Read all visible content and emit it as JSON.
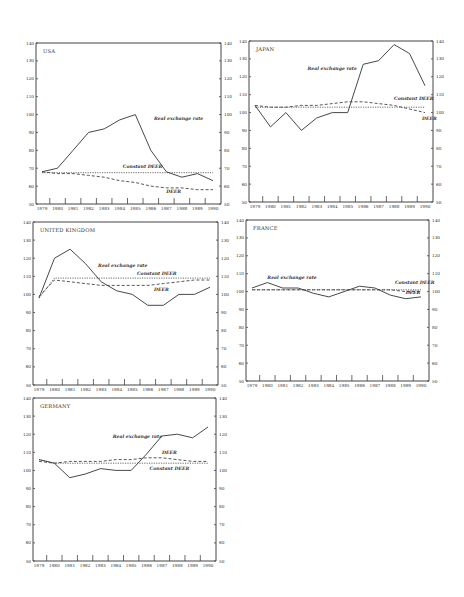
{
  "chart_data": [
    {
      "type": "line",
      "title": "USA",
      "x": [
        1979,
        1980,
        1981,
        1982,
        1983,
        1984,
        1985,
        1986,
        1987,
        1988,
        1989,
        1990
      ],
      "ylim": [
        50,
        140
      ],
      "yticks": [
        50,
        60,
        70,
        80,
        90,
        100,
        110,
        120,
        130,
        140
      ],
      "xlabel": "",
      "ylabel": "",
      "grid": false,
      "series": [
        {
          "name": "Real exchange rate",
          "style": "solid",
          "values": [
            68,
            70,
            80,
            90,
            92,
            97,
            100,
            80,
            68,
            65,
            67,
            63
          ]
        },
        {
          "name": "Constant DEER",
          "style": "dotted",
          "values": [
            67.5,
            67.5,
            67.5,
            67.5,
            67.5,
            67.5,
            67.5,
            67.5,
            67.5,
            67.5,
            67.5,
            67.5
          ]
        },
        {
          "name": "DEER",
          "style": "dashed",
          "values": [
            68,
            67,
            67,
            66,
            65,
            63,
            62,
            60,
            59,
            59,
            58,
            58
          ]
        }
      ],
      "annotations": [
        {
          "text": "Real exchange rate",
          "x": 1986.2,
          "y": 97
        },
        {
          "text": "Constant DEER",
          "x": 1984.2,
          "y": 70
        },
        {
          "text": "DEER",
          "x": 1987.0,
          "y": 56
        }
      ]
    },
    {
      "type": "line",
      "title": "JAPAN",
      "x": [
        1979,
        1980,
        1981,
        1982,
        1983,
        1984,
        1985,
        1986,
        1987,
        1988,
        1989,
        1990
      ],
      "ylim": [
        50,
        140
      ],
      "yticks": [
        50,
        60,
        70,
        80,
        90,
        100,
        110,
        120,
        130,
        140
      ],
      "xlabel": "",
      "ylabel": "",
      "grid": false,
      "series": [
        {
          "name": "Real exchange rate",
          "style": "solid",
          "values": [
            104,
            92,
            100,
            90,
            97,
            100,
            100,
            127,
            129,
            138,
            133,
            115
          ]
        },
        {
          "name": "Constant DEER",
          "style": "dotted",
          "values": [
            103,
            103,
            103,
            103,
            103,
            103,
            103,
            103,
            103,
            103,
            103,
            103
          ]
        },
        {
          "name": "DEER",
          "style": "dashed",
          "values": [
            104,
            103,
            103,
            104,
            104,
            105,
            106,
            106,
            105,
            104,
            102,
            100
          ]
        }
      ],
      "annotations": [
        {
          "text": "Real exchange rate",
          "x": 1982.4,
          "y": 124
        },
        {
          "text": "Constant DEER",
          "x": 1988.0,
          "y": 107
        },
        {
          "text": "DEER",
          "x": 1989.8,
          "y": 96
        }
      ]
    },
    {
      "type": "line",
      "title": "UNITED KINGDOM",
      "x": [
        1979,
        1980,
        1981,
        1982,
        1983,
        1984,
        1985,
        1986,
        1987,
        1988,
        1989,
        1990
      ],
      "ylim": [
        50,
        140
      ],
      "yticks": [
        50,
        60,
        70,
        80,
        90,
        100,
        110,
        120,
        130,
        140
      ],
      "xlabel": "",
      "ylabel": "",
      "grid": false,
      "series": [
        {
          "name": "Real exchange rate",
          "style": "solid",
          "values": [
            98,
            120,
            125,
            117,
            107,
            102,
            100,
            94,
            94,
            100,
            100,
            104
          ]
        },
        {
          "name": "Constant DEER",
          "style": "dotted",
          "values": [
            98,
            109,
            109,
            109,
            109,
            109,
            109,
            109,
            109,
            109,
            109,
            109
          ]
        },
        {
          "name": "DEER",
          "style": "dashed",
          "values": [
            99,
            108,
            107,
            106,
            105,
            105,
            105,
            105,
            106,
            107,
            108,
            108
          ]
        }
      ],
      "annotations": [
        {
          "text": "Real exchange rate",
          "x": 1982.8,
          "y": 115
        },
        {
          "text": "Constant DEER",
          "x": 1985.3,
          "y": 111
        },
        {
          "text": "DEER",
          "x": 1986.4,
          "y": 102
        }
      ]
    },
    {
      "type": "line",
      "title": "FRANCE",
      "x": [
        1979,
        1980,
        1981,
        1982,
        1983,
        1984,
        1985,
        1986,
        1987,
        1988,
        1989,
        1990
      ],
      "ylim": [
        50,
        140
      ],
      "yticks": [
        50,
        60,
        70,
        80,
        90,
        100,
        110,
        120,
        130,
        140
      ],
      "xlabel": "",
      "ylabel": "",
      "grid": false,
      "series": [
        {
          "name": "Real exchange rate",
          "style": "solid",
          "values": [
            102,
            105,
            102,
            102,
            99,
            97,
            100,
            103,
            102,
            98,
            96,
            97
          ]
        },
        {
          "name": "Constant DEER",
          "style": "dotted",
          "values": [
            101,
            101,
            101,
            101,
            101,
            101,
            101,
            101,
            101,
            101,
            101,
            101
          ]
        },
        {
          "name": "DEER",
          "style": "dashed",
          "values": [
            101,
            101,
            101,
            101,
            101,
            101,
            101,
            101,
            101,
            101,
            100,
            100
          ]
        }
      ],
      "annotations": [
        {
          "text": "Real exchange rate",
          "x": 1980.0,
          "y": 107
        },
        {
          "text": "Constant DEER",
          "x": 1988.3,
          "y": 104
        },
        {
          "text": "DEER",
          "x": 1989.0,
          "y": 98.5
        }
      ]
    },
    {
      "type": "line",
      "title": "GERMANY",
      "x": [
        1979,
        1980,
        1981,
        1982,
        1983,
        1984,
        1985,
        1986,
        1987,
        1988,
        1989,
        1990
      ],
      "ylim": [
        50,
        140
      ],
      "yticks": [
        50,
        60,
        70,
        80,
        90,
        100,
        110,
        120,
        130,
        140
      ],
      "xlabel": "",
      "ylabel": "",
      "grid": false,
      "series": [
        {
          "name": "Real exchange rate",
          "style": "solid",
          "values": [
            106,
            104,
            96,
            98,
            101,
            100,
            100,
            109,
            119,
            120,
            118,
            124
          ]
        },
        {
          "name": "DEER",
          "style": "dashed",
          "values": [
            105,
            104,
            105,
            105,
            105,
            106,
            106,
            107,
            107,
            106,
            105,
            105
          ]
        },
        {
          "name": "Constant DEER",
          "style": "dotted",
          "values": [
            106,
            104,
            104,
            104,
            104,
            104,
            104,
            104,
            104,
            104,
            104,
            104
          ]
        }
      ],
      "annotations": [
        {
          "text": "Real exchange rate",
          "x": 1983.8,
          "y": 118
        },
        {
          "text": "DEER",
          "x": 1987.0,
          "y": 109
        },
        {
          "text": "Constant DEER",
          "x": 1986.2,
          "y": 100
        }
      ]
    }
  ],
  "panels": [
    {
      "title": "USA"
    },
    {
      "title": "JAPAN"
    },
    {
      "title": "UNITED KINGDOM"
    },
    {
      "title": "FRANCE"
    },
    {
      "title": "GERMANY"
    }
  ]
}
